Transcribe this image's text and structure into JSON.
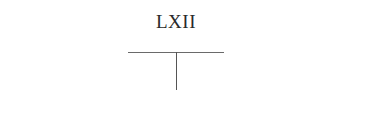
{
  "document": {
    "heading": "LXII",
    "diagram": {
      "type": "t-chart",
      "line_color": "#6a6a6a"
    }
  }
}
